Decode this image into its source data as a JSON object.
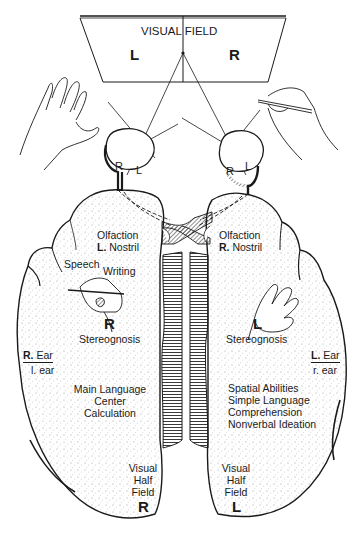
{
  "title": "Visual Field",
  "visual_field": {
    "title": "VISUAL FIELD",
    "left_label": "L",
    "right_label": "R"
  },
  "eyes": {
    "left_eye": {
      "retina_labels": [
        "R",
        "L"
      ]
    },
    "right_eye": {
      "retina_labels": [
        "R",
        "L"
      ]
    }
  },
  "left_hemisphere": {
    "olfaction": "Olfaction",
    "nostril_prefix": "L.",
    "nostril": "Nostril",
    "speech": "Speech",
    "writing": "Writing",
    "hand_label": "R",
    "stereognosis": "Stereognosis",
    "ear_major_prefix": "R.",
    "ear_major": "Ear",
    "ear_minor": "l. ear",
    "functions": [
      "Main Language",
      "Center",
      "Calculation"
    ],
    "visual_half_field": [
      "Visual",
      "Half",
      "Field"
    ],
    "field_label": "R"
  },
  "right_hemisphere": {
    "olfaction": "Olfaction",
    "nostril_prefix": "R.",
    "nostril": "Nostril",
    "hand_label": "L",
    "stereognosis": "Stereognosis",
    "ear_major_prefix": "L.",
    "ear_major": "Ear",
    "ear_minor": "r. ear",
    "functions": [
      "Spatial Abilities",
      "Simple Language",
      "Comprehension",
      "Nonverbal Ideation"
    ],
    "visual_half_field": [
      "Visual",
      "Half",
      "Field"
    ],
    "field_label": "L"
  },
  "colors": {
    "ink": "#1a1a1a",
    "stipple": "#555555",
    "background": "#ffffff"
  }
}
